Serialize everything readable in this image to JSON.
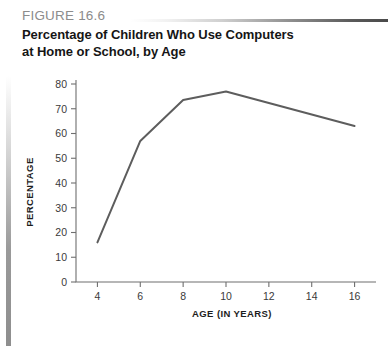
{
  "figure": {
    "label": "FIGURE 16.6",
    "title_line1": "Percentage of Children Who Use Computers",
    "title_line2": "at Home or School, by Age"
  },
  "colors": {
    "label_gray": "#8c8c8c",
    "title_black": "#151515",
    "line_gray": "#5d5d5d",
    "axis_gray": "#6f6f6f",
    "rule_dark": "#4a4a4a"
  },
  "chart_data": {
    "type": "line",
    "title": "Percentage of Children Who Use Computers at Home or School, by Age",
    "xlabel": "AGE (IN YEARS)",
    "ylabel": "PERCENTAGE",
    "x": [
      4,
      6,
      8,
      10,
      16
    ],
    "values": [
      16,
      57,
      73.5,
      77,
      63
    ],
    "series": [
      {
        "name": "Percentage of children using computers",
        "x": [
          4,
          6,
          8,
          10,
          16
        ],
        "values": [
          16,
          57,
          73.5,
          77,
          63
        ]
      }
    ],
    "xlim": [
      3,
      17
    ],
    "ylim": [
      0,
      80
    ],
    "xticks": [
      4,
      6,
      8,
      10,
      12,
      14,
      16
    ],
    "xtick_labels": [
      "4",
      "6",
      "8",
      "10",
      "12",
      "14",
      "16"
    ],
    "yticks": [
      0,
      10,
      20,
      30,
      40,
      50,
      60,
      70,
      80
    ],
    "ytick_labels": [
      "0",
      "10",
      "20",
      "30",
      "40",
      "50",
      "60",
      "70",
      "80"
    ],
    "grid": false,
    "legend": "none",
    "markers": "none"
  }
}
